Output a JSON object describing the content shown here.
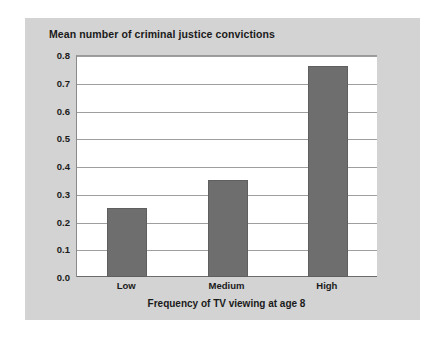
{
  "chart_data": {
    "type": "bar",
    "title": "Mean number of criminal justice convictions",
    "xlabel": "Frequency of TV viewing at age 8",
    "ylabel": "",
    "categories": [
      "Low",
      "Medium",
      "High"
    ],
    "values": [
      0.25,
      0.35,
      0.76
    ],
    "series": [
      {
        "name": "Mean number of criminal justice convictions",
        "values": [
          0.25,
          0.35,
          0.76
        ]
      }
    ],
    "ylim": [
      0.0,
      0.8
    ],
    "ytick_labels": [
      "0.8",
      "0.7",
      "0.6",
      "0.5",
      "0.4",
      "0.3",
      "0.2",
      "0.1",
      "0.0"
    ],
    "ytick_values": [
      0.8,
      0.7,
      0.6,
      0.5,
      0.4,
      0.3,
      0.2,
      0.1,
      0.0
    ],
    "grid": true,
    "legend": false,
    "legend_position": "none",
    "colors": {
      "bar_fill": "#6e6e6e",
      "bar_edge": "#5f5f5f",
      "panel_background": "#d3d3d3",
      "plot_background": "#ffffff",
      "gridline": "#9e9e9e",
      "text": "#1a1a1a",
      "page_background": "#ffffff"
    }
  }
}
